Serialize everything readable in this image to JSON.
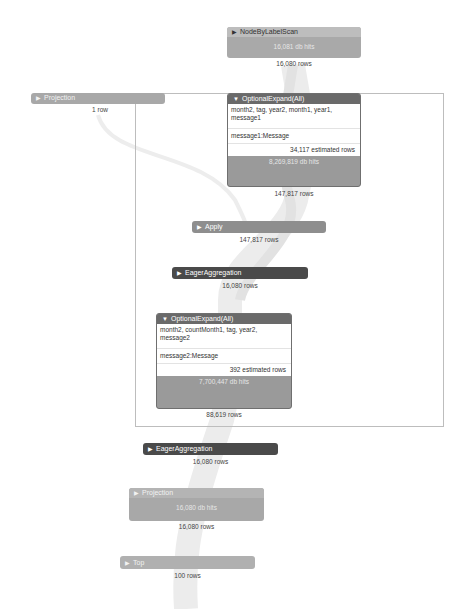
{
  "header": {
    "faded_text": ""
  },
  "operators": [
    {
      "id": "nodebylabelscan",
      "name": "NodeByLabelScan",
      "collapsed": true,
      "db_hits": "16,081 db hits",
      "rows_out": "16,080 rows"
    },
    {
      "id": "projection-1",
      "name": "Projection",
      "collapsed": true,
      "rows_out": "1 row"
    },
    {
      "id": "optionalexpand-1",
      "name": "OptionalExpand(All)",
      "collapsed": false,
      "identifiers": "month2, tag, year2, month1, year1, message1",
      "expression": "message1:Message",
      "estimated_rows": "34,117 estimated rows",
      "db_hits": "8,269,819 db hits",
      "rows_out": "147,817 rows"
    },
    {
      "id": "apply",
      "name": "Apply",
      "collapsed": true,
      "rows_out": "147,817 rows"
    },
    {
      "id": "eageraggregation-1",
      "name": "EagerAggregation",
      "collapsed": true,
      "rows_out": "16,080 rows"
    },
    {
      "id": "optionalexpand-2",
      "name": "OptionalExpand(All)",
      "collapsed": false,
      "identifiers": "month2, countMonth1, tag, year2, message2",
      "expression": "message2:Message",
      "estimated_rows": "392 estimated rows",
      "db_hits": "7,700,447 db hits",
      "rows_out": "88,619 rows"
    },
    {
      "id": "eageraggregation-2",
      "name": "EagerAggregation",
      "collapsed": true,
      "rows_out": "16,080 rows"
    },
    {
      "id": "projection-2",
      "name": "Projection",
      "collapsed": true,
      "db_hits": "16,080 db hits",
      "rows_out": "16,080 rows"
    },
    {
      "id": "top",
      "name": "Top",
      "collapsed": true,
      "rows_out": "100 rows"
    }
  ],
  "icons": {
    "collapsed": "▶",
    "expanded": "▼"
  },
  "colors": {
    "pipe": "#ececec",
    "dark_header": "#4a4a4a",
    "light_header": "#a8a8a8",
    "frame": "#bdbdbd"
  }
}
